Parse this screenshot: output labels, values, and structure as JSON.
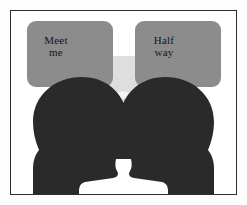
{
  "image": {
    "title": "Two silhouetted heads with speech bubbles meeting halfway",
    "background_color": "#ffffff",
    "frame_color": "#2e2e2e"
  },
  "watermark": {
    "name": "heart-spiral-watermark",
    "color": "#d8d8d8",
    "spiral_color": "#f2f2f2"
  },
  "bubbles": [
    {
      "id": "left",
      "name": "speech-bubble-left",
      "fill": "#8c8c8c",
      "line1": "Meet",
      "line2": "me"
    },
    {
      "id": "right",
      "name": "speech-bubble-right",
      "fill": "#8c8c8c",
      "line1": "Half",
      "line2": "way"
    }
  ],
  "heads": [
    {
      "id": "left",
      "name": "head-silhouette-left",
      "fill": "#2a2a2a",
      "facing": "right"
    },
    {
      "id": "right",
      "name": "head-silhouette-right",
      "fill": "#2a2a2a",
      "facing": "left"
    }
  ],
  "tails": {
    "name": "speech-bubble-tails",
    "stroke": "#8c8c8c",
    "crossing": "x-shape"
  }
}
